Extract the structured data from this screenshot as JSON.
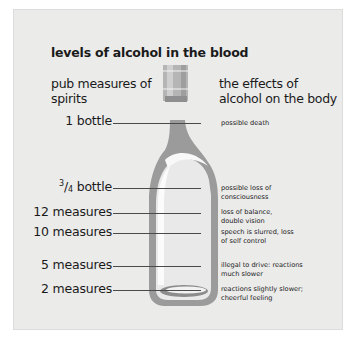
{
  "title": "levels of alcohol in the blood",
  "headers": {
    "left": "pub measures of spirits",
    "right": "the effects of alcohol on the body"
  },
  "colors": {
    "panel_bg": "#ebebea",
    "bottle_fill": "#9b9b9b",
    "bottle_light": "#f5f5f5",
    "leader_line": "#4a4a4a"
  },
  "rows": [
    {
      "measure": "1 bottle",
      "effect": "possible death"
    },
    {
      "measure_num": "3",
      "measure_den": "4",
      "measure": "bottle",
      "effect": "possible loss of consciousness"
    },
    {
      "measure": "12 measures",
      "effect": "loss of balance, double vision"
    },
    {
      "measure": "10 measures",
      "effect": "speech is slurred, loss of self control"
    },
    {
      "measure": "5 measures",
      "effect": "illegal to drive: reactions much slower"
    },
    {
      "measure": "2 measures",
      "effect": "reactions slightly slower; cheerful feeling"
    }
  ]
}
